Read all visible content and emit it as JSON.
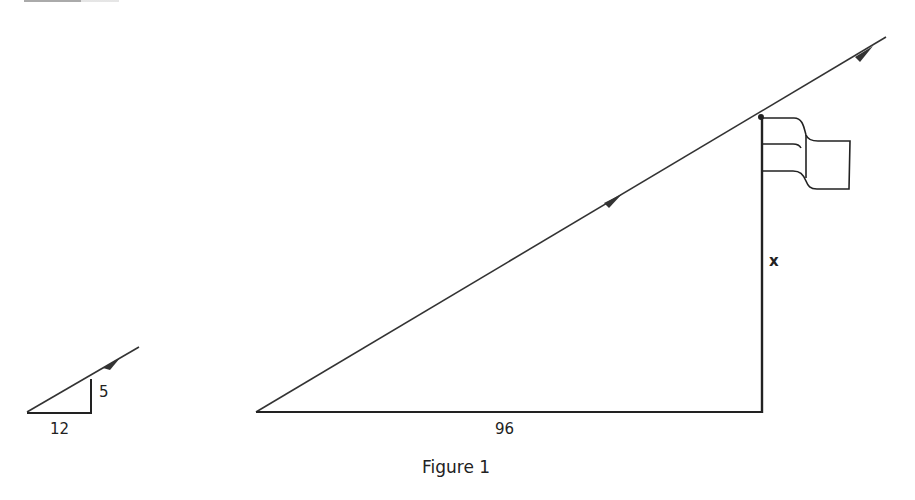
{
  "figure": {
    "caption": "Figure 1",
    "small_triangle": {
      "vertical_label": "5",
      "horizontal_label": "12"
    },
    "large_triangle": {
      "base_label": "96",
      "height_label": "x"
    },
    "colors": {
      "stroke": "#333333",
      "background": "#ffffff"
    }
  }
}
